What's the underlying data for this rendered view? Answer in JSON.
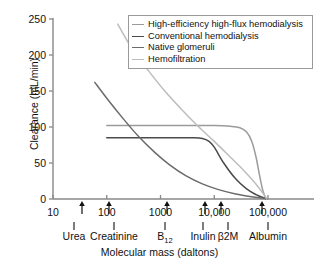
{
  "chart_data": {
    "type": "line",
    "title": "",
    "xlabel": "Molecular mass (daltons)",
    "ylabel": "Clearance (mL/min)",
    "xscale": "log",
    "xlim": [
      10,
      200000
    ],
    "ylim": [
      0,
      250
    ],
    "yticks": [
      0,
      50,
      100,
      150,
      200,
      250
    ],
    "ytick_labels": [
      "0",
      "50",
      "100",
      "150",
      "200",
      "250"
    ],
    "xticks": [
      10,
      100,
      1000,
      10000,
      100000
    ],
    "xtick_labels": [
      "10",
      "100",
      "1000",
      "10,000",
      "100,000"
    ],
    "grid": false,
    "legend_position": "top-right",
    "series": [
      {
        "name": "High-efficiency high-flux hemodialysis",
        "color": "#9b9b9b",
        "points": [
          [
            100,
            102
          ],
          [
            300,
            102
          ],
          [
            1000,
            102
          ],
          [
            3000,
            102
          ],
          [
            10000,
            102
          ],
          [
            20000,
            101
          ],
          [
            30000,
            99
          ],
          [
            40000,
            93
          ],
          [
            50000,
            80
          ],
          [
            60000,
            58
          ],
          [
            70000,
            32
          ],
          [
            80000,
            12
          ],
          [
            90000,
            2
          ],
          [
            95000,
            0
          ]
        ]
      },
      {
        "name": "Conventional hemodialysis",
        "color": "#4a4a4a",
        "points": [
          [
            100,
            85
          ],
          [
            300,
            85
          ],
          [
            1000,
            85
          ],
          [
            2000,
            85
          ],
          [
            4000,
            85
          ],
          [
            6000,
            84
          ],
          [
            8000,
            80
          ],
          [
            10000,
            72
          ],
          [
            15000,
            50
          ],
          [
            25000,
            28
          ],
          [
            40000,
            14
          ],
          [
            60000,
            6
          ],
          [
            80000,
            2
          ],
          [
            95000,
            0
          ]
        ]
      },
      {
        "name": "Native glomeruli",
        "color": "#6b6b6b",
        "points": [
          [
            60,
            162
          ],
          [
            100,
            140
          ],
          [
            200,
            112
          ],
          [
            400,
            86
          ],
          [
            800,
            64
          ],
          [
            1500,
            47
          ],
          [
            3000,
            32
          ],
          [
            6000,
            21
          ],
          [
            12000,
            13
          ],
          [
            25000,
            7
          ],
          [
            50000,
            3
          ],
          [
            80000,
            1
          ],
          [
            95000,
            0
          ]
        ]
      },
      {
        "name": "Hemofiltration",
        "color": "#bdbdbd",
        "points": [
          [
            160,
            243
          ],
          [
            300,
            208
          ],
          [
            600,
            178
          ],
          [
            1200,
            150
          ],
          [
            2500,
            124
          ],
          [
            5000,
            101
          ],
          [
            10000,
            80
          ],
          [
            20000,
            58
          ],
          [
            35000,
            40
          ],
          [
            55000,
            24
          ],
          [
            75000,
            11
          ],
          [
            90000,
            3
          ],
          [
            95000,
            0
          ]
        ]
      }
    ],
    "markers": [
      {
        "label": "Urea",
        "mass": 60,
        "label_x": 74,
        "arrow_x": 82
      },
      {
        "label": "Creatinine",
        "mass": 113,
        "label_x": 114,
        "arrow_x": 109
      },
      {
        "label": "B12",
        "label_text": "B",
        "sub": "12",
        "mass": 1355,
        "label_x": 165,
        "arrow_x": 167
      },
      {
        "label": "Inulin",
        "mass": 5200,
        "label_x": 203,
        "arrow_x": 205
      },
      {
        "label": "B2M",
        "label_text": "β2M",
        "mass": 11800,
        "label_x": 228,
        "arrow_x": 221
      },
      {
        "label": "Albumin",
        "mass": 66000,
        "label_x": 268,
        "arrow_x": 262
      }
    ]
  },
  "legend": {
    "items": [
      "High-efficiency high-flux hemodialysis",
      "Conventional hemodialysis",
      "Native glomeruli",
      "Hemofiltration"
    ]
  },
  "colors": {
    "axis": "#888888",
    "text": "#111111",
    "legend_border": "#9a9a9a",
    "background": "#ffffff"
  }
}
